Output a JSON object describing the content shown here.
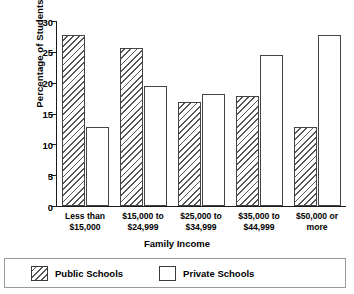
{
  "chart_data": {
    "type": "bar",
    "title": "",
    "xlabel": "Family Income",
    "ylabel": "Percentage of Students",
    "categories": [
      "Less than\n$15,000",
      "$15,000 to\n$24,999",
      "$25,000 to\n$34,999",
      "$35,000 to\n$44,999",
      "$50,000 or\nmore"
    ],
    "category_lines": [
      [
        "Less than",
        "$15,000"
      ],
      [
        "$15,000 to",
        "$24,999"
      ],
      [
        "$25,000 to",
        "$34,999"
      ],
      [
        "$35,000 to",
        "$44,999"
      ],
      [
        "$50,000 or",
        "more"
      ]
    ],
    "series": [
      {
        "name": "Public Schools",
        "pattern": "diagonal-hatch",
        "values": [
          27.8,
          25.6,
          16.8,
          17.9,
          12.8
        ]
      },
      {
        "name": "Private Schools",
        "pattern": "empty",
        "values": [
          12.8,
          19.5,
          18.1,
          24.5,
          27.8
        ]
      }
    ],
    "ylim": [
      0,
      30
    ],
    "ytick_values": [
      0,
      5,
      10,
      15,
      20,
      25,
      30
    ],
    "ytick_labels": [
      "0",
      "5",
      "10",
      "15",
      "20",
      "25",
      "30"
    ],
    "grid": false,
    "legend_position": "bottom",
    "legend_entries": [
      "Public Schools",
      "Private Schools"
    ],
    "colors": {
      "bar_outline": "#444444",
      "hatch": "#555555",
      "fill": "#ffffff",
      "axis": "#1a1a1a",
      "text": "#000000"
    }
  }
}
